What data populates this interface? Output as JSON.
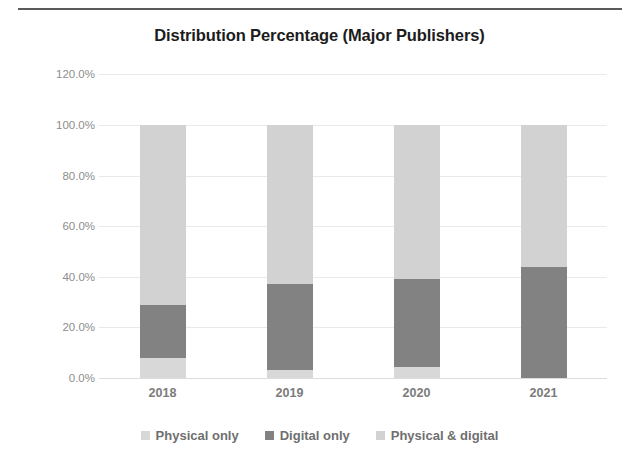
{
  "top_rule": "horizontal-rule",
  "chart_data": {
    "type": "bar",
    "subtype": "stacked-bar-percent",
    "title": "Distribution Percentage (Major Publishers)",
    "xlabel": "",
    "ylabel": "",
    "categories": [
      "2018",
      "2019",
      "2020",
      "2021"
    ],
    "ylim": [
      0,
      120
    ],
    "ytick_labels": [
      "120.0%",
      "100.0%",
      "80.0%",
      "60.0%",
      "40.0%",
      "20.0%",
      "0.0%"
    ],
    "ytick_values": [
      120,
      100,
      80,
      60,
      40,
      20,
      0
    ],
    "grid": true,
    "legend_position": "bottom",
    "series": [
      {
        "name": "Physical only",
        "color": "#d8d8d8",
        "values": [
          8.0,
          3.0,
          4.5,
          0.0
        ]
      },
      {
        "name": "Digital only",
        "color": "#828282",
        "values": [
          21.0,
          34.0,
          34.5,
          44.0
        ]
      },
      {
        "name": "Physical & digital",
        "color": "#d2d2d2",
        "values": [
          71.0,
          63.0,
          61.0,
          56.0
        ]
      }
    ]
  }
}
